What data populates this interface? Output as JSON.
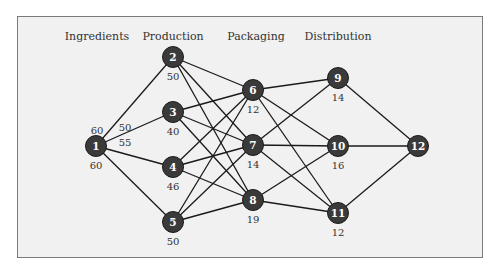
{
  "diagram": {
    "stages": [
      {
        "label": "Ingredients",
        "x": 97
      },
      {
        "label": "Production",
        "x": 173
      },
      {
        "label": "Packaging",
        "x": 256
      },
      {
        "label": "Distribution",
        "x": 338
      }
    ],
    "nodes": [
      {
        "id": "1",
        "x": 96,
        "y": 146,
        "value": "60"
      },
      {
        "id": "2",
        "x": 173,
        "y": 57,
        "value": "50"
      },
      {
        "id": "3",
        "x": 173,
        "y": 112,
        "value": "40"
      },
      {
        "id": "4",
        "x": 173,
        "y": 167,
        "value": "46"
      },
      {
        "id": "5",
        "x": 173,
        "y": 222,
        "value": "50"
      },
      {
        "id": "6",
        "x": 253,
        "y": 90,
        "value": "12"
      },
      {
        "id": "7",
        "x": 253,
        "y": 145,
        "value": "14"
      },
      {
        "id": "8",
        "x": 253,
        "y": 200,
        "value": "19"
      },
      {
        "id": "9",
        "x": 338,
        "y": 78,
        "value": "14"
      },
      {
        "id": "10",
        "x": 338,
        "y": 146,
        "value": "16"
      },
      {
        "id": "11",
        "x": 338,
        "y": 213,
        "value": "12"
      },
      {
        "id": "12",
        "x": 418,
        "y": 146,
        "value": ""
      }
    ],
    "edges": [
      [
        "1",
        "2"
      ],
      [
        "1",
        "3"
      ],
      [
        "1",
        "4"
      ],
      [
        "1",
        "5"
      ],
      [
        "2",
        "6"
      ],
      [
        "2",
        "7"
      ],
      [
        "2",
        "8"
      ],
      [
        "3",
        "6"
      ],
      [
        "3",
        "7"
      ],
      [
        "3",
        "8"
      ],
      [
        "4",
        "6"
      ],
      [
        "4",
        "7"
      ],
      [
        "4",
        "8"
      ],
      [
        "5",
        "6"
      ],
      [
        "5",
        "7"
      ],
      [
        "5",
        "8"
      ],
      [
        "6",
        "9"
      ],
      [
        "6",
        "10"
      ],
      [
        "6",
        "11"
      ],
      [
        "7",
        "9"
      ],
      [
        "7",
        "10"
      ],
      [
        "7",
        "11"
      ],
      [
        "8",
        "10"
      ],
      [
        "8",
        "11"
      ],
      [
        "9",
        "12"
      ],
      [
        "10",
        "12"
      ],
      [
        "11",
        "12"
      ]
    ],
    "extra_labels": [
      {
        "text": "60",
        "x": 97,
        "y": 134,
        "note": "node 1 upper value"
      },
      {
        "text": "50",
        "x": 125,
        "y": 131,
        "note": "edge 1-2 / 1-3"
      },
      {
        "text": "55",
        "x": 125,
        "y": 146,
        "note": "edge 1-4"
      }
    ],
    "colors": {
      "background": "#f1f1f1",
      "border": "#7a7a7a",
      "node_fill": "#3a3a3a",
      "edge": "#1a1a1a",
      "text": "#333333"
    }
  }
}
